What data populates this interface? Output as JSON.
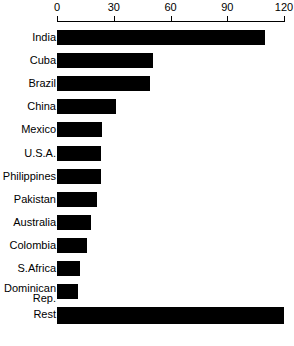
{
  "chart_data": {
    "type": "bar",
    "orientation": "horizontal",
    "title": "",
    "subtitle": "",
    "xlabel": "",
    "ylabel": "",
    "xlim": [
      0,
      120
    ],
    "grid": false,
    "legend": null,
    "axis_position": "top",
    "tick_labels": [
      "0",
      "30",
      "60",
      "90",
      "120"
    ],
    "tick_values": [
      0,
      30,
      60,
      90,
      120
    ],
    "categories": [
      "India",
      "Cuba",
      "Brazil",
      "China",
      "Mexico",
      "U.S.A.",
      "Philippines",
      "Pakistan",
      "Australia",
      "Colombia",
      "S.Africa",
      "Dominican Rep.",
      "Rest"
    ],
    "values": [
      110,
      51,
      49,
      31,
      24,
      23,
      23,
      21,
      18,
      16,
      12,
      11,
      120
    ],
    "bars": [
      {
        "label": "India",
        "label_lines": [
          "India"
        ],
        "value": 110
      },
      {
        "label": "Cuba",
        "label_lines": [
          "Cuba"
        ],
        "value": 51
      },
      {
        "label": "Brazil",
        "label_lines": [
          "Brazil"
        ],
        "value": 49
      },
      {
        "label": "China",
        "label_lines": [
          "China"
        ],
        "value": 31
      },
      {
        "label": "Mexico",
        "label_lines": [
          "Mexico"
        ],
        "value": 24
      },
      {
        "label": "U.S.A.",
        "label_lines": [
          "U.S.A."
        ],
        "value": 23
      },
      {
        "label": "Philippines",
        "label_lines": [
          "Philippines"
        ],
        "value": 23
      },
      {
        "label": "Pakistan",
        "label_lines": [
          "Pakistan"
        ],
        "value": 21
      },
      {
        "label": "Australia",
        "label_lines": [
          "Australia"
        ],
        "value": 18
      },
      {
        "label": "Colombia",
        "label_lines": [
          "Colombia"
        ],
        "value": 16
      },
      {
        "label": "S.Africa",
        "label_lines": [
          "S.Africa"
        ],
        "value": 12
      },
      {
        "label": "Dominican Rep.",
        "label_lines": [
          "Dominican",
          "Rep."
        ],
        "value": 11
      },
      {
        "label": "Rest",
        "label_lines": [
          "Rest"
        ],
        "value": 120
      }
    ],
    "colors": {
      "bar": "#000000",
      "axis": "#000000",
      "text": "#000000",
      "background": "#ffffff"
    }
  }
}
